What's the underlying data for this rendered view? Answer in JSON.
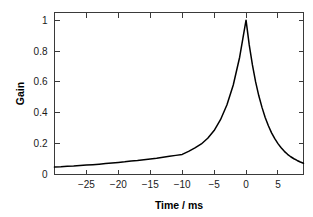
{
  "chart_data": {
    "type": "line",
    "title": "",
    "xlabel": "Time / ms",
    "ylabel": "Gain",
    "xlim": [
      -30,
      9
    ],
    "ylim": [
      0,
      1.05
    ],
    "grid": false,
    "legend": null,
    "xticks": [
      -25,
      -20,
      -15,
      -10,
      -5,
      0,
      5
    ],
    "xtick_labels": [
      "−25",
      "−20",
      "−15",
      "−10",
      "−5",
      "0",
      "5"
    ],
    "yticks": [
      0,
      0.2,
      0.4,
      0.6,
      0.8,
      1
    ],
    "ytick_labels": [
      "0",
      "0.2",
      "0.4",
      "0.6",
      "0.8",
      "1"
    ],
    "series": [
      {
        "name": "Gain",
        "color": "#000000",
        "x": [
          -30,
          -29,
          -28,
          -27,
          -26,
          -25,
          -24,
          -23,
          -22,
          -21,
          -20,
          -19,
          -18,
          -17,
          -16,
          -15,
          -14,
          -13,
          -12,
          -11,
          -10,
          -9,
          -8,
          -7,
          -6,
          -5,
          -4,
          -3,
          -2,
          -1,
          -0.5,
          0,
          0.5,
          1,
          1.5,
          2,
          2.5,
          3,
          3.5,
          4,
          4.5,
          5,
          5.5,
          6,
          6.5,
          7,
          7.5,
          8,
          8.5,
          9
        ],
        "y": [
          0.048,
          0.05,
          0.053,
          0.055,
          0.058,
          0.061,
          0.064,
          0.067,
          0.071,
          0.074,
          0.078,
          0.082,
          0.087,
          0.091,
          0.096,
          0.101,
          0.106,
          0.112,
          0.118,
          0.124,
          0.13,
          0.15,
          0.172,
          0.198,
          0.235,
          0.285,
          0.355,
          0.45,
          0.58,
          0.76,
          0.88,
          1.0,
          0.84,
          0.71,
          0.6,
          0.51,
          0.435,
          0.37,
          0.316,
          0.27,
          0.232,
          0.2,
          0.173,
          0.15,
          0.131,
          0.115,
          0.102,
          0.091,
          0.081,
          0.073
        ]
      }
    ]
  },
  "axes": {
    "ylabel_text": "Gain",
    "xlabel_text": "Time / ms"
  }
}
